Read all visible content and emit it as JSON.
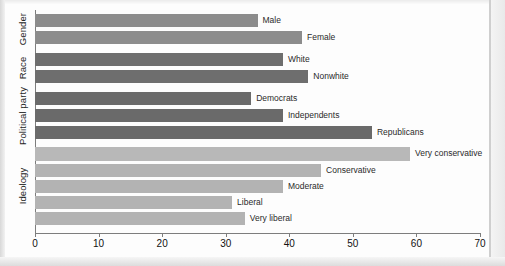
{
  "chart_data": {
    "type": "bar",
    "orientation": "horizontal",
    "title": "",
    "xlabel": "",
    "ylabel": "",
    "xlim": [
      0,
      70
    ],
    "grid": false,
    "legend": "none",
    "xticks": [
      "0",
      "10",
      "20",
      "30",
      "40",
      "50",
      "60",
      "70"
    ],
    "xtick_values": [
      0,
      10,
      20,
      30,
      40,
      50,
      60,
      70
    ],
    "groups": [
      {
        "name": "Gender",
        "color": "#8c8c8c",
        "categories": [
          "Male",
          "Female"
        ],
        "values": [
          35,
          42
        ]
      },
      {
        "name": "Race",
        "color": "#6e6e6e",
        "categories": [
          "White",
          "Nonwhite"
        ],
        "values": [
          39,
          43
        ]
      },
      {
        "name": "Political party",
        "color": "#6e6e6e",
        "categories": [
          "Democrats",
          "Independents",
          "Republicans"
        ],
        "values": [
          34,
          39,
          53
        ]
      },
      {
        "name": "Ideology",
        "color": "#b3b3b3",
        "categories": [
          "Very conservative",
          "Conservative",
          "Moderate",
          "Liberal",
          "Very liberal"
        ],
        "values": [
          59,
          45,
          39,
          31,
          33
        ]
      }
    ],
    "bars": [
      {
        "label": "Male",
        "value": 35,
        "group": "Gender",
        "color": "#8c8c8c"
      },
      {
        "label": "Female",
        "value": 42,
        "group": "Gender",
        "color": "#8c8c8c"
      },
      {
        "label": "White",
        "value": 39,
        "group": "Race",
        "color": "#6e6e6e"
      },
      {
        "label": "Nonwhite",
        "value": 43,
        "group": "Race",
        "color": "#6e6e6e"
      },
      {
        "label": "Democrats",
        "value": 34,
        "group": "Political party",
        "color": "#6a6a6a"
      },
      {
        "label": "Independents",
        "value": 39,
        "group": "Political party",
        "color": "#6a6a6a"
      },
      {
        "label": "Republicans",
        "value": 53,
        "group": "Political party",
        "color": "#6a6a6a"
      },
      {
        "label": "Very conservative",
        "value": 59,
        "group": "Ideology",
        "color": "#b8b8b8"
      },
      {
        "label": "Conservative",
        "value": 45,
        "group": "Ideology",
        "color": "#b3b3b3"
      },
      {
        "label": "Moderate",
        "value": 39,
        "group": "Ideology",
        "color": "#b3b3b3"
      },
      {
        "label": "Liberal",
        "value": 31,
        "group": "Ideology",
        "color": "#b3b3b3"
      },
      {
        "label": "Very liberal",
        "value": 33,
        "group": "Ideology",
        "color": "#b3b3b3"
      }
    ]
  },
  "axis": {
    "group_labels": [
      "Gender",
      "Race",
      "Political party",
      "Ideology"
    ]
  }
}
